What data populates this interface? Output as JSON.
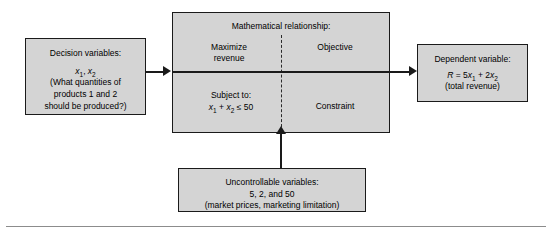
{
  "diagram": {
    "type": "flow-diagram",
    "background_color": "#ffffff",
    "box_fill_color": "#d4d4d4",
    "box_border_color": "#1a1a1a",
    "connector_color": "#1a1a1a"
  },
  "decision_box": {
    "heading": "Decision variables:",
    "variables": "x1, x2",
    "line1": "(What quantities of",
    "line2": "products 1 and 2",
    "line3": "should be produced?)"
  },
  "math_box": {
    "title": "Mathematical relationship:",
    "objective_left_line1": "Maximize",
    "objective_left_line2": "revenue",
    "objective_right": "Objective",
    "constraint_left_line1": "Subject to:",
    "constraint_left_line2": "x1 + x2 ≤ 50",
    "constraint_right": "Constraint"
  },
  "dependent_box": {
    "heading": "Dependent variable:",
    "equation": "R = 5x1 + 2x2",
    "note": "(total revenue)"
  },
  "uncontrollable_box": {
    "heading": "Uncontrollable variables:",
    "values": "5, 2, and 50",
    "note": "(market prices, marketing limitation)"
  },
  "connectors": {
    "decision_to_math": "arrow-right",
    "math_to_dependent": "arrow-right",
    "uncontrollable_to_math": "arrow-up"
  }
}
